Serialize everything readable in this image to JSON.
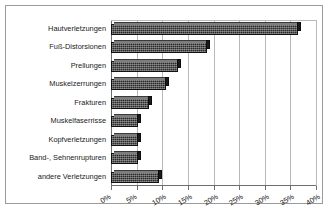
{
  "chart_data": {
    "type": "bar",
    "orientation": "horizontal",
    "title": "",
    "subtitle": "",
    "xlabel": "",
    "ylabel": "",
    "xlim": [
      0,
      40
    ],
    "xtick_step": 5,
    "grid": true,
    "legend": null,
    "axis_tick_format": "percent",
    "categories": [
      "Hautverletzungen",
      "Fuß-Distorsionen",
      "Prellungen",
      "Muskelzerrungen",
      "Frakturen",
      "Muskelfaserrisse",
      "Kopfverletzungen",
      "Band-, Sehnenrupturen",
      "andere Verletzungen"
    ],
    "values": [
      36.5,
      18.7,
      13.0,
      10.7,
      7.4,
      5.3,
      5.3,
      5.2,
      9.4
    ],
    "xticks": [
      0,
      5,
      10,
      15,
      20,
      25,
      30,
      35,
      40
    ],
    "xticklabels": [
      "0%",
      "5%",
      "10%",
      "15%",
      "20%",
      "25%",
      "30%",
      "35%",
      "40%"
    ],
    "bar_color": "#2b2b2b",
    "bar_edge_color": "#111111",
    "bar_style": "3d-textured",
    "grid_color": "#b9b9b9",
    "axis_color": "#6e6e6e",
    "background": "#ffffff",
    "frame_color": "#9a9a9a"
  }
}
